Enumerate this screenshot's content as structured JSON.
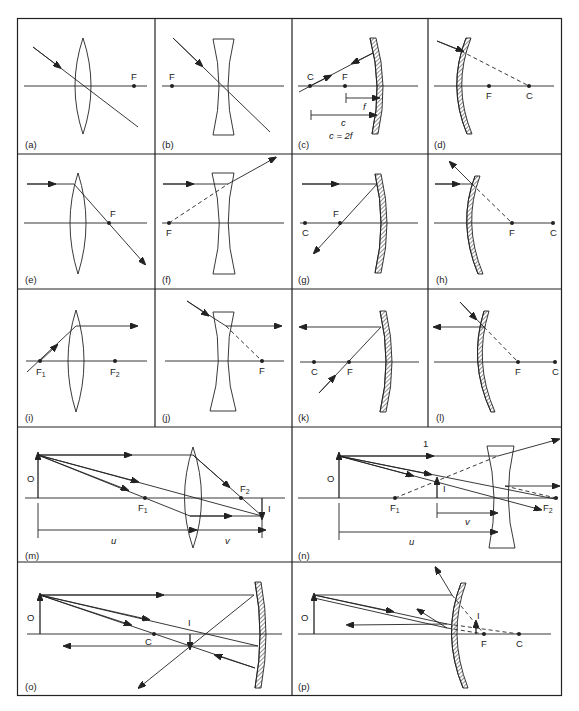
{
  "figure": {
    "type": "optics ray diagrams",
    "panels": [
      {
        "id": "a",
        "label": "(a)",
        "element": "converging lens",
        "points": [
          "F"
        ]
      },
      {
        "id": "b",
        "label": "(b)",
        "element": "diverging lens",
        "points": [
          "F"
        ]
      },
      {
        "id": "c",
        "label": "(c)",
        "element": "concave mirror",
        "points": [
          "C",
          "F"
        ],
        "dims": [
          "f",
          "c"
        ],
        "equation": "c = 2f"
      },
      {
        "id": "d",
        "label": "(d)",
        "element": "convex mirror",
        "points": [
          "F",
          "C"
        ]
      },
      {
        "id": "e",
        "label": "(e)",
        "element": "converging lens",
        "points": [
          "F"
        ]
      },
      {
        "id": "f",
        "label": "(f)",
        "element": "diverging lens",
        "points": [
          "F"
        ]
      },
      {
        "id": "g",
        "label": "(g)",
        "element": "concave mirror",
        "points": [
          "C",
          "F"
        ]
      },
      {
        "id": "h",
        "label": "(h)",
        "element": "convex mirror",
        "points": [
          "F",
          "C"
        ]
      },
      {
        "id": "i",
        "label": "(i)",
        "element": "converging lens",
        "points": [
          "F1",
          "F2"
        ]
      },
      {
        "id": "j",
        "label": "(j)",
        "element": "diverging lens",
        "points": [
          "F"
        ]
      },
      {
        "id": "k",
        "label": "(k)",
        "element": "concave mirror",
        "points": [
          "C",
          "F"
        ]
      },
      {
        "id": "l",
        "label": "(l)",
        "element": "convex mirror",
        "points": [
          "F",
          "C"
        ]
      },
      {
        "id": "m",
        "label": "(m)",
        "element": "converging lens image formation",
        "points": [
          "O",
          "F1",
          "F2",
          "I"
        ],
        "dims": [
          "u",
          "v"
        ]
      },
      {
        "id": "n",
        "label": "(n)",
        "element": "diverging lens image formation",
        "points": [
          "O",
          "I",
          "F1",
          "F2",
          "1"
        ],
        "dims": [
          "v",
          "u"
        ]
      },
      {
        "id": "o",
        "label": "(o)",
        "element": "concave mirror image formation",
        "points": [
          "O",
          "C",
          "I"
        ]
      },
      {
        "id": "p",
        "label": "(p)",
        "element": "convex mirror image formation",
        "points": [
          "O",
          "I",
          "F",
          "C"
        ]
      }
    ]
  },
  "text": {
    "F": "F",
    "C": "C",
    "O": "O",
    "I": "I",
    "one": "1",
    "F1": "F",
    "F2": "F",
    "sub1": "1",
    "sub2": "2",
    "f": "f",
    "c": "c",
    "c_eq": "c = 2f",
    "u": "u",
    "v": "v",
    "la": "(a)",
    "lb": "(b)",
    "lc": "(c)",
    "ld": "(d)",
    "le": "(e)",
    "lf": "(f)",
    "lg": "(g)",
    "lh": "(h)",
    "li": "(i)",
    "lj": "(j)",
    "lk": "(k)",
    "ll": "(l)",
    "lm": "(m)",
    "ln": "(n)",
    "lo": "(o)",
    "lp": "(p)"
  }
}
